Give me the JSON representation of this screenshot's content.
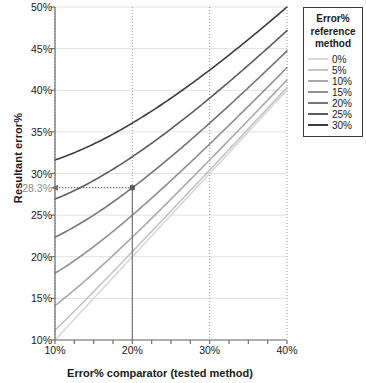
{
  "chart_data": {
    "type": "line",
    "title": "",
    "xlabel": "Error% comparator (tested method)",
    "ylabel": "Resultant error%",
    "xlim": [
      10,
      40
    ],
    "ylim": [
      10,
      50
    ],
    "xticks": [
      "10%",
      "20%",
      "30%",
      "40%"
    ],
    "xtick_values": [
      10,
      20,
      30,
      40
    ],
    "yticks": [
      "10%",
      "15%",
      "20%",
      "25%",
      "30%",
      "35%",
      "40%",
      "45%",
      "50%"
    ],
    "ytick_values": [
      10,
      15,
      20,
      25,
      30,
      35,
      40,
      45,
      50
    ],
    "grid": "horizontal solid light-gray, vertical dotted gray at each x tick",
    "legend_position": "outside right, top",
    "legend_title": "Error% reference method",
    "relationship": "resultant = sqrt(comparator^2 + reference^2)",
    "x": [
      10,
      15,
      20,
      25,
      30,
      35,
      40
    ],
    "series": [
      {
        "name": "0%",
        "reference": 0,
        "color": "#d9d9d9",
        "values": [
          10.0,
          15.0,
          20.0,
          25.0,
          30.0,
          35.0,
          40.0
        ]
      },
      {
        "name": "5%",
        "reference": 5,
        "color": "#c4c4c4",
        "values": [
          11.18,
          15.81,
          20.62,
          25.5,
          30.41,
          35.36,
          40.31
        ]
      },
      {
        "name": "10%",
        "reference": 10,
        "color": "#a8a8a8",
        "values": [
          14.14,
          18.03,
          22.36,
          26.93,
          31.62,
          36.4,
          41.23
        ]
      },
      {
        "name": "15%",
        "reference": 15,
        "color": "#8f8f8f",
        "values": [
          18.03,
          21.21,
          25.0,
          29.15,
          33.54,
          38.08,
          42.72
        ]
      },
      {
        "name": "20%",
        "reference": 20,
        "color": "#757575",
        "values": [
          22.36,
          25.0,
          28.28,
          32.02,
          36.06,
          40.31,
          44.72
        ]
      },
      {
        "name": "25%",
        "reference": 25,
        "color": "#5c5c5c",
        "values": [
          26.93,
          29.15,
          32.02,
          35.36,
          39.05,
          43.01,
          47.17
        ]
      },
      {
        "name": "30%",
        "reference": 30,
        "color": "#3d3d3d",
        "values": [
          31.62,
          33.54,
          36.06,
          39.05,
          42.43,
          46.1,
          50.0
        ]
      }
    ],
    "annotation": {
      "label": "28.3%",
      "x": 20,
      "y": 28.3,
      "series": "20%",
      "description": "dotted arrow from point (20%, 28.3%) leftward to y-axis label 28.3%, with solid vertical drop line to x-axis at 20%"
    }
  },
  "legend": {
    "title_line1": "Error%",
    "title_line2": "reference",
    "title_line3": "method",
    "items": [
      {
        "label": "0%"
      },
      {
        "label": "5%"
      },
      {
        "label": "10%"
      },
      {
        "label": "15%"
      },
      {
        "label": "20%"
      },
      {
        "label": "25%"
      },
      {
        "label": "30%"
      }
    ]
  },
  "colors": {
    "axis": "#6e6e6e",
    "gridline_h": "#e2e2e2",
    "gridline_v": "#9a9a9a",
    "annotation": "#8c8c8c",
    "text": "#1a1a1a"
  }
}
